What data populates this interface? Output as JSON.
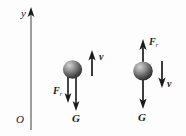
{
  "figure": {
    "background_color": "#fdfdfd",
    "ink_color": "#1a1a1a",
    "sphere_color_light": "#b9b9b9",
    "sphere_color_dark": "#2e2e2e",
    "width": 186,
    "height": 136
  },
  "axis": {
    "name": "vertical-y-axis",
    "label": "y",
    "origin_label": "O",
    "orientation": "vertical",
    "arrow_at": "top"
  },
  "left_case": {
    "name": "ball-moving-upward",
    "ball_label": "",
    "vectors": [
      {
        "symbol": "F",
        "subscript": "r",
        "label": "F",
        "direction": "down",
        "role": "resistance-force"
      },
      {
        "symbol": "G",
        "subscript": "",
        "label": "G",
        "direction": "down",
        "role": "gravity-force"
      },
      {
        "symbol": "v",
        "subscript": "",
        "label": "v",
        "direction": "up",
        "role": "velocity"
      }
    ],
    "force_label": "F",
    "force_subscript": "r",
    "gravity_label": "G",
    "velocity_label": "v"
  },
  "right_case": {
    "name": "ball-moving-downward",
    "ball_label": "",
    "vectors": [
      {
        "symbol": "F",
        "subscript": "r",
        "label": "F",
        "direction": "up",
        "role": "resistance-force"
      },
      {
        "symbol": "G",
        "subscript": "",
        "label": "G",
        "direction": "down",
        "role": "gravity-force"
      },
      {
        "symbol": "v",
        "subscript": "",
        "label": "v",
        "direction": "down",
        "role": "velocity"
      }
    ],
    "force_label": "F",
    "force_subscript": "r",
    "gravity_label": "G",
    "velocity_label": "v"
  }
}
